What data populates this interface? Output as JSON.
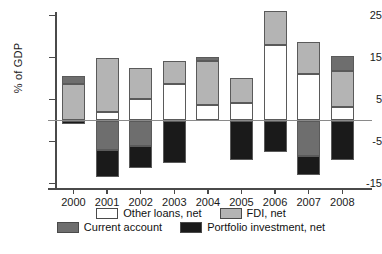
{
  "chart_data": {
    "type": "bar",
    "subtype": "stacked-bar-diverging",
    "title": "",
    "xlabel": "",
    "ylabel": "% of GDP",
    "ylim": [
      -15,
      25
    ],
    "yticks": [
      25,
      15,
      5,
      -5,
      -15
    ],
    "ytick_labels": [
      "25",
      "15",
      "5",
      "-5",
      "-15"
    ],
    "grid": false,
    "zero_line": true,
    "legend_position": "bottom",
    "categories": [
      "2000",
      "2001",
      "2002",
      "2003",
      "2004",
      "2005",
      "2006",
      "2007",
      "2008"
    ],
    "series": [
      {
        "name": "Other loans, net",
        "color": "#ffffff",
        "values": [
          0.0,
          2.0,
          5.2,
          8.8,
          3.6,
          4.1,
          18.0,
          11.0,
          3.2
        ]
      },
      {
        "name": "FDI, net",
        "color": "#b4b4b4",
        "values": [
          8.6,
          13.0,
          7.2,
          5.4,
          10.5,
          6.1,
          8.0,
          7.7,
          8.7
        ]
      },
      {
        "name": "Current account",
        "color": "#6e6e6e",
        "values": [
          2.0,
          -7.0,
          -6.0,
          0.0,
          1.1,
          0.0,
          0.0,
          -8.5,
          3.5
        ]
      },
      {
        "name": "Portfolio investment, net",
        "color": "#1a1a1a",
        "values": [
          -0.8,
          -6.4,
          -5.2,
          -10.0,
          0.0,
          -9.5,
          -7.6,
          -4.5,
          -9.5
        ]
      }
    ]
  },
  "axis": {
    "y_title": "% of GDP",
    "y_tick_labels": [
      "25",
      "15",
      "5",
      "-5",
      "-15"
    ],
    "x_tick_labels": [
      "2000",
      "2001",
      "2002",
      "2003",
      "2004",
      "2005",
      "2006",
      "2007",
      "2008"
    ]
  },
  "legend": {
    "row1": [
      {
        "label": "Other loans, net",
        "swatch": "white"
      },
      {
        "label": "FDI, net",
        "swatch": "light-gray"
      }
    ],
    "row2": [
      {
        "label": "Current account",
        "swatch": "medium-gray"
      },
      {
        "label": "Portfolio investment, net",
        "swatch": "black"
      }
    ]
  },
  "colors": {
    "other_loans": "#ffffff",
    "fdi": "#b4b4b4",
    "current_account": "#6e6e6e",
    "portfolio": "#1a1a1a",
    "axis": "#4a4a4a",
    "zero_line": "#8a8a8a"
  }
}
